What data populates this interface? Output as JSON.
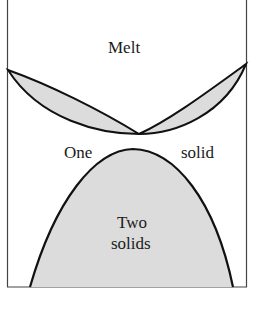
{
  "diagram": {
    "type": "phase-diagram",
    "labels": {
      "melt": "Melt",
      "one": "One",
      "solid": "solid",
      "two": "Two",
      "solids": "solids"
    },
    "colors": {
      "fill": "#dcdcdc",
      "stroke": "#111111",
      "frame": "#444444"
    }
  }
}
